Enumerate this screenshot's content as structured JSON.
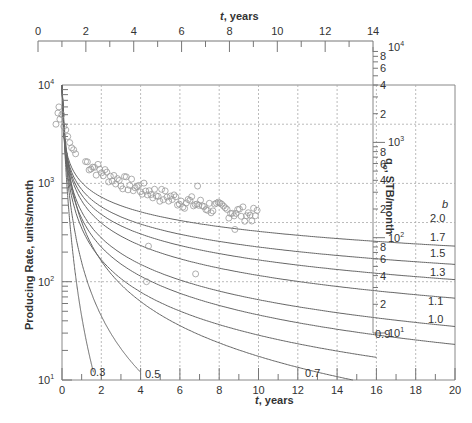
{
  "chart_data": {
    "type": "line",
    "title": "",
    "xlabel": "t, years",
    "ylabel": "Producing Rate, units/month",
    "xlim": [
      0,
      20
    ],
    "ylim": [
      10,
      10000
    ],
    "yscale": "log",
    "x_ticks": [
      0,
      2,
      4,
      6,
      8,
      10,
      12,
      14,
      16,
      18,
      20
    ],
    "y_ticks": [
      "10^1",
      "10^2",
      "10^3",
      "10^4"
    ],
    "grid": "dotted at x=2,4,...,18 and y=100,400,1000,4000",
    "top_axis": {
      "label": "t, years",
      "ticks": [
        0,
        2,
        4,
        6,
        8,
        10,
        12,
        14
      ]
    },
    "right_axis": {
      "label": "qo, STB/month",
      "ticks": [
        "10^1",
        "2",
        "4",
        "6",
        "8",
        "10^2",
        "2",
        "4",
        "6",
        "8",
        "10^3",
        "2",
        "4",
        "6",
        "8",
        "10^4"
      ]
    },
    "legend_title": "b",
    "series": [
      {
        "name": "b=2.0",
        "label": "2.0",
        "end": {
          "x": 20,
          "y": 230
        }
      },
      {
        "name": "b=1.7",
        "label": "1.7",
        "end": {
          "x": 20,
          "y": 150
        }
      },
      {
        "name": "b=1.5",
        "label": "1.5",
        "end": {
          "x": 20,
          "y": 105
        }
      },
      {
        "name": "b=1.3",
        "label": "1.3",
        "end": {
          "x": 20,
          "y": 68
        }
      },
      {
        "name": "b=1.1",
        "label": "1.1",
        "end": {
          "x": 20,
          "y": 35
        }
      },
      {
        "name": "b=1.0",
        "label": "1.0",
        "end": {
          "x": 20,
          "y": 23
        }
      },
      {
        "name": "b=0.9",
        "label": "0.9",
        "end": {
          "x": 16,
          "y": 17
        }
      },
      {
        "name": "b=0.7",
        "label": "0.7",
        "end": {
          "x": 14.8,
          "y": 10
        }
      },
      {
        "name": "b=0.5",
        "label": "0.5",
        "end": {
          "x": 4,
          "y": 12
        }
      },
      {
        "name": "b=0.3",
        "label": "0.3",
        "end": {
          "x": 1.6,
          "y": 12
        }
      }
    ],
    "scatter": {
      "name": "observed data",
      "x_range": [
        0,
        10
      ],
      "y_range": [
        300,
        6000
      ]
    }
  }
}
